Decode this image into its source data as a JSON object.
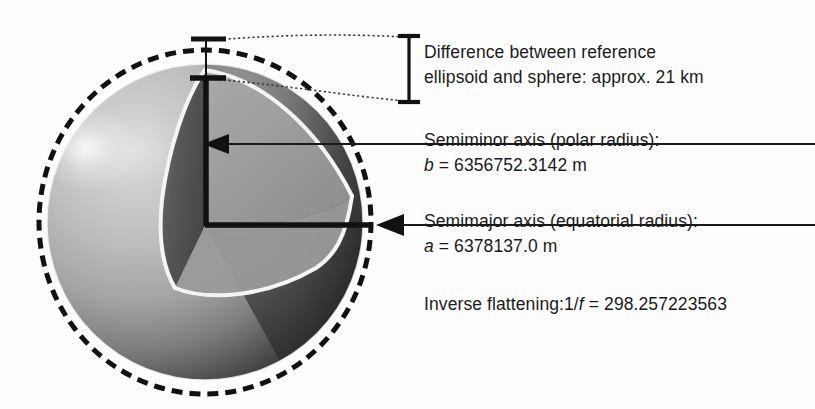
{
  "figure": {
    "background_color": "#fdfdfd",
    "sphere": {
      "name": "earth-sphere-cutaway",
      "center_x": 205,
      "center_y": 222,
      "radius": 158,
      "fill_light": "#c2c2c2",
      "fill_mid": "#8f8f8f",
      "fill_dark": "#2b2b2b",
      "highlight_color": "#d8d8d8",
      "inner_face_left_color": "#565656",
      "inner_face_right_color": "#9d9d9d",
      "cut_edge_color": "#f2f2f2"
    },
    "ellipsoid_outline": {
      "name": "reference-ellipsoid-dashed-outline",
      "center_x": 205,
      "center_y": 222,
      "radius_x": 166,
      "radius_y": 172,
      "stroke": "#111111",
      "dash": "11 7",
      "stroke_width": 5
    },
    "axes": {
      "stroke": "#111111",
      "polar_axis_x": 205,
      "polar_axis_top_y": 78,
      "equatorial_axis_y": 225,
      "equatorial_axis_right_x": 378
    },
    "bracket": {
      "name": "difference-measure-bracket",
      "x": 409,
      "top_y": 35,
      "bottom_y": 103,
      "stroke": "#111111"
    }
  },
  "labels": {
    "difference": {
      "line1": "Difference between reference",
      "line2": "ellipsoid and sphere: approx. 21 km"
    },
    "semiminor": {
      "line1": "Semiminor axis (polar radius):",
      "symbol": "b",
      "equals": " = 6356752.3142 m"
    },
    "semimajor": {
      "line1": "Semimajor axis (equatorial radius):",
      "symbol": "a",
      "equals": " = 6378137.0 m"
    },
    "flattening": {
      "prefix": "Inverse flattening:1/",
      "symbol": "f",
      "equals": " = 298.257223563"
    }
  }
}
